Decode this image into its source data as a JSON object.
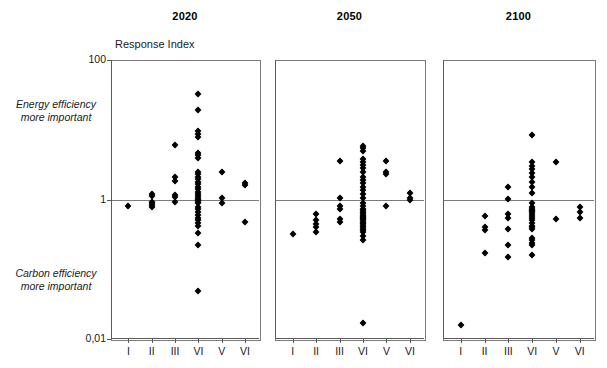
{
  "figure": {
    "axis_title": "Response Index",
    "y_ticks": [
      "100",
      "1",
      "0,01"
    ],
    "y_top_value": 100,
    "y_bottom_value": 0.01,
    "reference_line_value": 1,
    "annotation_upper": "Energy efficiency\nmore important",
    "annotation_upper_line1": "Energy efficiency",
    "annotation_upper_line2": "more important",
    "annotation_lower_line1": "Carbon efficiency",
    "annotation_lower_line2": "more important",
    "marker_color": "#000000",
    "frame_color": "#7b7b7b"
  },
  "chart_data": {
    "type": "scatter",
    "title": "",
    "xlabel": "",
    "ylabel": "Response Index",
    "yscale": "log",
    "ylim": [
      0.01,
      100
    ],
    "ytick_labels": [
      "100",
      "1",
      "0,01"
    ],
    "ytick_values": [
      100,
      1,
      0.01
    ],
    "grid": false,
    "legend": "none",
    "reference_lines": [
      {
        "axis": "y",
        "value": 1
      }
    ],
    "categories": [
      "I",
      "II",
      "III",
      "VI",
      "V",
      "VI"
    ],
    "panels": [
      {
        "title": "2020",
        "columns": [
          {
            "category": "I",
            "values": [
              0.8
            ]
          },
          {
            "category": "II",
            "values": [
              1.18,
              1.12,
              0.92,
              0.88,
              0.84,
              0.78
            ]
          },
          {
            "category": "III",
            "values": [
              6.0,
              2.1,
              1.85,
              1.15,
              1.1,
              0.92
            ]
          },
          {
            "category": "VI",
            "values": [
              33.0,
              19.0,
              9.5,
              8.6,
              8.0,
              4.6,
              4.3,
              4.0,
              2.5,
              2.3,
              2.1,
              1.95,
              1.8,
              1.65,
              1.5,
              1.4,
              1.3,
              1.2,
              1.12,
              1.05,
              1.0,
              0.97,
              0.92,
              0.88,
              0.78,
              0.72,
              0.66,
              0.6,
              0.55,
              0.5,
              0.46,
              0.42,
              0.33,
              0.22,
              0.048
            ]
          },
          {
            "category": "V",
            "values": [
              2.5,
              1.05,
              0.88
            ]
          },
          {
            "category": "VI",
            "values": [
              1.75,
              1.6,
              0.48
            ]
          }
        ]
      },
      {
        "title": "2050",
        "columns": [
          {
            "category": "I",
            "values": [
              0.32
            ]
          },
          {
            "category": "II",
            "values": [
              0.62,
              0.5,
              0.45,
              0.4,
              0.34
            ]
          },
          {
            "category": "III",
            "values": [
              3.6,
              1.05,
              0.8,
              0.72,
              0.52,
              0.47
            ]
          },
          {
            "category": "VI",
            "values": [
              5.8,
              5.4,
              5.0,
              3.8,
              3.4,
              3.1,
              2.8,
              2.5,
              2.1,
              1.9,
              1.7,
              1.5,
              1.35,
              1.2,
              1.05,
              0.88,
              0.8,
              0.74,
              0.7,
              0.66,
              0.63,
              0.6,
              0.58,
              0.56,
              0.54,
              0.52,
              0.5,
              0.48,
              0.46,
              0.44,
              0.42,
              0.4,
              0.38,
              0.36,
              0.34,
              0.3,
              0.26,
              0.017
            ]
          },
          {
            "category": "V",
            "values": [
              3.6,
              2.5,
              2.3,
              0.82
            ]
          },
          {
            "category": "VI",
            "values": [
              1.25,
              1.05,
              0.98
            ]
          }
        ]
      },
      {
        "title": "2100",
        "columns": [
          {
            "category": "I",
            "values": [
              0.016
            ]
          },
          {
            "category": "II",
            "values": [
              0.58,
              0.4,
              0.36,
              0.17
            ]
          },
          {
            "category": "III",
            "values": [
              1.5,
              1.02,
              0.62,
              0.54,
              0.38,
              0.22,
              0.15
            ]
          },
          {
            "category": "VI",
            "values": [
              8.5,
              3.5,
              3.0,
              2.7,
              2.4,
              2.1,
              1.8,
              1.5,
              1.22,
              0.9,
              0.78,
              0.74,
              0.7,
              0.68,
              0.66,
              0.62,
              0.58,
              0.54,
              0.5,
              0.46,
              0.42,
              0.4,
              0.38,
              0.28,
              0.26,
              0.24,
              0.22,
              0.16
            ]
          },
          {
            "category": "V",
            "values": [
              3.4,
              0.52
            ]
          },
          {
            "category": "VI",
            "values": [
              0.78,
              0.66,
              0.54
            ]
          }
        ]
      }
    ]
  }
}
